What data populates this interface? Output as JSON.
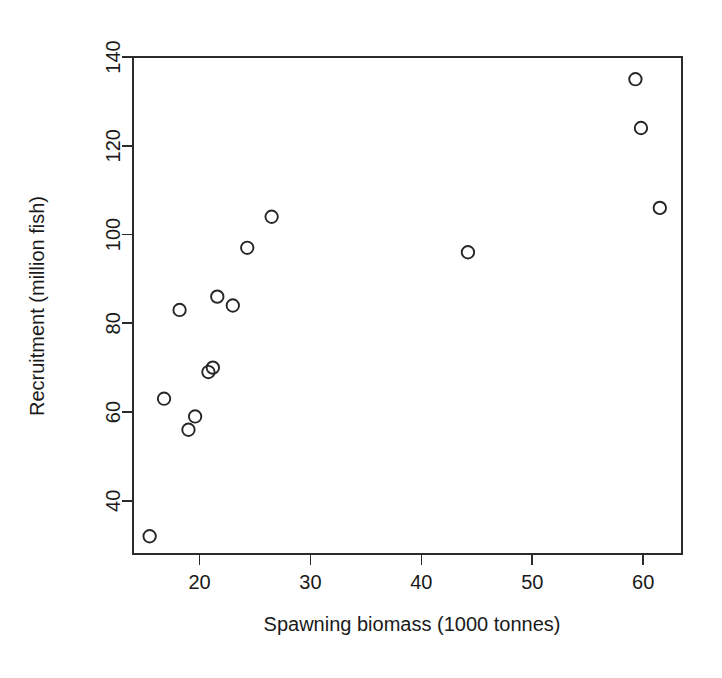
{
  "chart_data": {
    "type": "scatter",
    "title": "",
    "xlabel": "Spawning biomass (1000 tonnes)",
    "ylabel": "Recruitment (million fish)",
    "xlim": [
      14.0,
      63.5
    ],
    "ylim": [
      28.0,
      140.0
    ],
    "xticks": [
      20,
      30,
      40,
      50,
      60
    ],
    "xticklabels": [
      "20",
      "30",
      "40",
      "50",
      "60"
    ],
    "yticks": [
      40,
      60,
      80,
      100,
      120,
      140
    ],
    "yticklabels": [
      "40",
      "60",
      "80",
      "100",
      "120",
      "140"
    ],
    "grid": false,
    "legend": null,
    "marker": "open-circle",
    "points": [
      {
        "x": 15.5,
        "y": 32.0
      },
      {
        "x": 16.8,
        "y": 63.0
      },
      {
        "x": 18.2,
        "y": 83.0
      },
      {
        "x": 19.0,
        "y": 56.0
      },
      {
        "x": 19.6,
        "y": 59.0
      },
      {
        "x": 20.8,
        "y": 69.0
      },
      {
        "x": 21.2,
        "y": 70.0
      },
      {
        "x": 21.6,
        "y": 86.0
      },
      {
        "x": 23.0,
        "y": 84.0
      },
      {
        "x": 24.3,
        "y": 97.0
      },
      {
        "x": 26.5,
        "y": 104.0
      },
      {
        "x": 44.2,
        "y": 96.0
      },
      {
        "x": 59.3,
        "y": 135.0
      },
      {
        "x": 59.8,
        "y": 124.0
      },
      {
        "x": 61.5,
        "y": 106.0
      }
    ]
  },
  "figure": {
    "background_color": "#ffffff",
    "foreground_color": "#1a1a1a",
    "marker_color": "#262626"
  }
}
